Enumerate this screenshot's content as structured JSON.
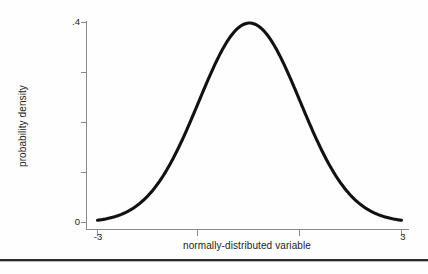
{
  "figure": {
    "background_color": "#ffffff",
    "axis_color": "#808080",
    "curve_color": "#111111",
    "text_color": "#222222",
    "rule_color": "#2a2a2a"
  },
  "chart_data": {
    "type": "line",
    "title": "",
    "subtitle": "",
    "xlabel": "normally-distributed variable",
    "ylabel": "probability density",
    "xlim": [
      -3,
      3
    ],
    "ylim": [
      0,
      0.4
    ],
    "grid": false,
    "legend": null,
    "legend_position": "none",
    "annotations": [],
    "xticks": [
      -3,
      -1,
      1,
      3
    ],
    "xticklabels": [
      "-3",
      "",
      "",
      "3"
    ],
    "yticks": [
      0,
      0.1,
      0.2,
      0.3,
      0.4
    ],
    "yticklabels": [
      "0",
      "",
      "",
      "",
      ".4"
    ],
    "series": [
      {
        "name": "standard normal density",
        "distribution": "normal",
        "mean": 0,
        "sd": 1,
        "x": [
          -3.0,
          -2.8,
          -2.6,
          -2.4,
          -2.2,
          -2.0,
          -1.8,
          -1.6,
          -1.4,
          -1.2,
          -1.0,
          -0.8,
          -0.6,
          -0.4,
          -0.2,
          0.0,
          0.2,
          0.4,
          0.6,
          0.8,
          1.0,
          1.2,
          1.4,
          1.6,
          1.8,
          2.0,
          2.2,
          2.4,
          2.6,
          2.8,
          3.0
        ],
        "values": [
          0.0044,
          0.0079,
          0.0136,
          0.0224,
          0.0355,
          0.054,
          0.079,
          0.1109,
          0.1497,
          0.1942,
          0.242,
          0.2897,
          0.3332,
          0.3683,
          0.391,
          0.3989,
          0.391,
          0.3683,
          0.3332,
          0.2897,
          0.242,
          0.1942,
          0.1497,
          0.1109,
          0.079,
          0.054,
          0.0355,
          0.0224,
          0.0136,
          0.0079,
          0.0044
        ]
      }
    ]
  },
  "labels": {
    "y_axis_title": "probability density",
    "x_axis_title": "normally-distributed variable",
    "y_tick_top": ".4",
    "y_tick_bottom": "0",
    "x_tick_left": "-3",
    "x_tick_right": "3"
  }
}
